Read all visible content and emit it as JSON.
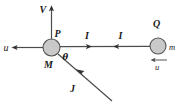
{
  "figure": {
    "background_color": "#ffffff",
    "body_fill_color": "#c9c9c9",
    "body_stroke_color": "#555555",
    "line_color": "#4d4d4d",
    "arrow_color": "#333333",
    "text_color": "#1a1a1a",
    "bodies": [
      {
        "name": "left-body",
        "label": "M",
        "point_label": "P",
        "cx": 51.5,
        "cy": 47.5,
        "r": 8.5
      },
      {
        "name": "right-body",
        "label": "m",
        "point_label": "Q",
        "cx": 158,
        "cy": 46,
        "r": 8
      }
    ],
    "labels": {
      "velocity_V": "V",
      "velocity_u_left": "u",
      "impulse_I_right": "I",
      "impulse_I_left": "I",
      "impulse_J": "J",
      "angle_theta": "θ",
      "mass_M": "M",
      "mass_m": "m",
      "point_P": "P",
      "point_Q": "Q",
      "velocity_u_bar": "u"
    }
  }
}
